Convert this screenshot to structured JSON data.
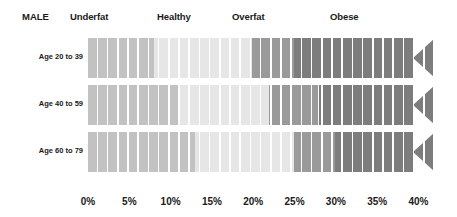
{
  "header": {
    "gender_title": "MALE",
    "categories": [
      {
        "label": "Underfat",
        "x": 70
      },
      {
        "label": "Healthy",
        "x": 157
      },
      {
        "label": "Overfat",
        "x": 232
      },
      {
        "label": "Obese",
        "x": 330
      }
    ]
  },
  "colors": {
    "underfat": "#c2c2c2",
    "healthy": "#e6e6e6",
    "overfat": "#9a9a9a",
    "obese": "#7d7d7d",
    "text": "#1a1a1a",
    "background": "#ffffff"
  },
  "axis": {
    "ticks": [
      "0%",
      "5%",
      "10%",
      "15%",
      "20%",
      "25%",
      "30%",
      "35%",
      "40%"
    ],
    "min": 0,
    "max": 42,
    "step": 5
  },
  "rows": [
    {
      "label": "Age 20 to 39"
    },
    {
      "label": "Age 40 to 59"
    },
    {
      "label": "Age 60 to 79"
    }
  ],
  "chart_data": {
    "type": "bar",
    "title": "MALE",
    "xlabel": "Body fat percentage",
    "ylabel": "",
    "xlim": [
      0,
      42
    ],
    "grid": false,
    "legend": [
      "Underfat",
      "Healthy",
      "Overfat",
      "Obese"
    ],
    "categories": [
      "Age 20 to 39",
      "Age 40 to 59",
      "Age 60 to 79"
    ],
    "series": [
      {
        "name": "Underfat",
        "values": [
          8.0,
          11.0,
          13.0
        ]
      },
      {
        "name": "Healthy",
        "values": [
          19.9,
          21.9,
          24.9
        ]
      },
      {
        "name": "Overfat",
        "values": [
          24.9,
          27.9,
          29.9
        ]
      },
      {
        "name": "Obese",
        "values": [
          42.0,
          42.0,
          42.0
        ]
      }
    ],
    "bands": [
      {
        "row": "Age 20 to 39",
        "ranges": [
          {
            "category": "Underfat",
            "start": 0,
            "end": 8.0
          },
          {
            "category": "Healthy",
            "start": 8.0,
            "end": 19.9
          },
          {
            "category": "Overfat",
            "start": 19.9,
            "end": 24.9
          },
          {
            "category": "Obese",
            "start": 24.9,
            "end": 42.0
          }
        ]
      },
      {
        "row": "Age 40 to 59",
        "ranges": [
          {
            "category": "Underfat",
            "start": 0,
            "end": 11.0
          },
          {
            "category": "Healthy",
            "start": 11.0,
            "end": 21.9
          },
          {
            "category": "Overfat",
            "start": 21.9,
            "end": 27.9
          },
          {
            "category": "Obese",
            "start": 27.9,
            "end": 42.0
          }
        ]
      },
      {
        "row": "Age 60 to 79",
        "ranges": [
          {
            "category": "Underfat",
            "start": 0,
            "end": 13.0
          },
          {
            "category": "Healthy",
            "start": 13.0,
            "end": 24.9
          },
          {
            "category": "Overfat",
            "start": 24.9,
            "end": 29.9
          },
          {
            "category": "Obese",
            "start": 29.9,
            "end": 42.0
          }
        ]
      }
    ]
  }
}
